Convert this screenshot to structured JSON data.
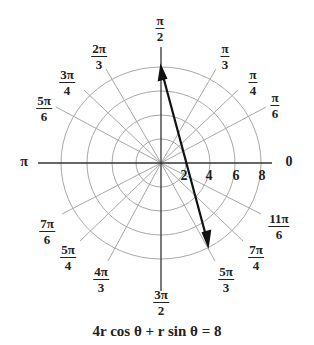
{
  "diagram": {
    "type": "polar-coordinate-graph",
    "center": {
      "x": 161,
      "y": 163
    },
    "radial_scale_px_per_unit": {
      "x": 12.5,
      "y": 12.0
    },
    "circles": [
      2,
      4,
      6,
      8
    ],
    "radial_tick_labels": [
      "2",
      "4",
      "6",
      "8"
    ],
    "angle_labels": [
      {
        "id": "a0",
        "text": "0",
        "num": "",
        "den": "",
        "deg": 0
      },
      {
        "id": "a30",
        "num": "π",
        "den": "6",
        "deg": 30
      },
      {
        "id": "a45",
        "num": "π",
        "den": "4",
        "deg": 45
      },
      {
        "id": "a60",
        "num": "π",
        "den": "3",
        "deg": 60
      },
      {
        "id": "a90",
        "num": "π",
        "den": "2",
        "deg": 90
      },
      {
        "id": "a120",
        "num": "2π",
        "den": "3",
        "deg": 120
      },
      {
        "id": "a135",
        "num": "3π",
        "den": "4",
        "deg": 135
      },
      {
        "id": "a150",
        "num": "5π",
        "den": "6",
        "deg": 150
      },
      {
        "id": "a180",
        "text": "π",
        "deg": 180
      },
      {
        "id": "a210",
        "num": "7π",
        "den": "6",
        "deg": 210
      },
      {
        "id": "a225",
        "num": "5π",
        "den": "4",
        "deg": 225
      },
      {
        "id": "a240",
        "num": "4π",
        "den": "3",
        "deg": 240
      },
      {
        "id": "a270",
        "num": "3π",
        "den": "2",
        "deg": 270
      },
      {
        "id": "a300",
        "num": "5π",
        "den": "3",
        "deg": 300
      },
      {
        "id": "a315",
        "num": "7π",
        "den": "4",
        "deg": 315
      },
      {
        "id": "a330",
        "num": "11π",
        "den": "6",
        "deg": 330
      }
    ],
    "line": {
      "description": "graph of 4x + y = 8 with arrows at both ends",
      "start": {
        "x": 0,
        "y": 8
      },
      "end": {
        "x": 3.8,
        "y": -7.2
      },
      "color": "#111111"
    },
    "equation": "4r cos θ + r sin θ = 8",
    "colors": {
      "grid": "#a8a8a8",
      "axes": "#333333",
      "line": "#111111",
      "text": "#222222"
    }
  }
}
